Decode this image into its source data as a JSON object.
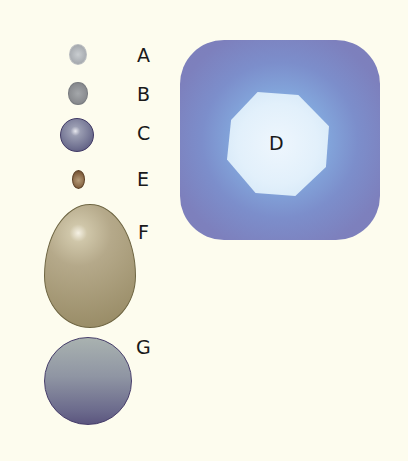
{
  "diagram": {
    "background": "#fdfcee",
    "shapes": [
      {
        "id": "A",
        "label": "A",
        "form": "small oval",
        "color": "#a7abb0"
      },
      {
        "id": "B",
        "label": "B",
        "form": "small oval",
        "color": "#888a8e"
      },
      {
        "id": "C",
        "label": "C",
        "form": "sphere",
        "color": "#6e6f8f"
      },
      {
        "id": "E",
        "label": "E",
        "form": "tiny oval",
        "color": "#7c5a39"
      },
      {
        "id": "F",
        "label": "F",
        "form": "egg",
        "color": "#b5a98a"
      },
      {
        "id": "G",
        "label": "G",
        "form": "large circle",
        "color": "#8f95a3"
      },
      {
        "id": "D",
        "label": "D",
        "form": "rounded square with octagon",
        "color": "#7d80bd",
        "inner_color": "#e2f0fb"
      }
    ]
  }
}
